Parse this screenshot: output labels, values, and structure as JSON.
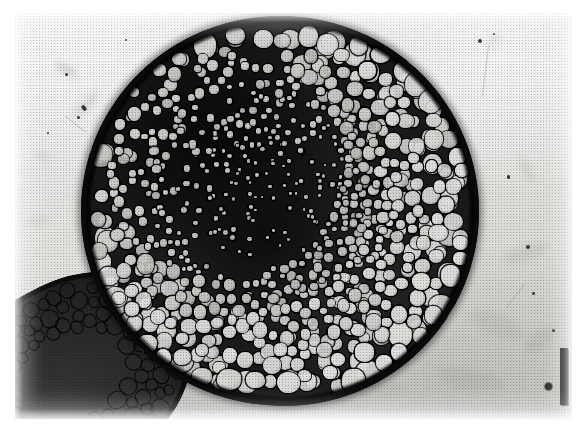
{
  "figure": {
    "kind": "light-micrograph",
    "caption_text": "",
    "background_color": "#e8e8e5",
    "ink_color": "#0a0a09",
    "plate": {
      "x": 15,
      "y": 13,
      "width": 557,
      "height": 406,
      "border_color": "#ffffff"
    }
  },
  "main_section": {
    "label": "primary circular cross-section",
    "center_x": 280,
    "center_y": 211,
    "width": 398,
    "height": 390,
    "rim_color": "#0a0a09",
    "matrix_color": "#1a1a19",
    "cell_color_light": "#ececea",
    "cell_color_mid": "#bdbdba",
    "rim_thickness_px": 7,
    "description": "dense field of rounded parenchyma cells, large at the periphery, smaller toward the centre, set in a dark-stained matrix"
  },
  "dark_core": {
    "label": "dark stained central mass",
    "center_x_pct": 36,
    "center_y_pct": 38,
    "color": "#090908"
  },
  "partial_section": {
    "label": "partial second section, lower left",
    "x": -52,
    "y": 282,
    "width": 248,
    "height": 190,
    "rotation_deg": -27,
    "rim_color": "#0d0d0c",
    "matrix_color": "#2c2c2a",
    "description": "obliquely cut fragment entering from the lower-left corner, showing its own dark boundary and a single rank of rounded cells"
  },
  "scale_bar": {
    "label": "scale-bar",
    "orientation": "vertical",
    "x": 560,
    "y": 348,
    "width": 8,
    "height": 57,
    "color": "#17171d",
    "caption": ""
  },
  "marker_dot": {
    "label": "reference dot beside scale bar",
    "x": 545,
    "y": 383,
    "diameter": 7,
    "color": "#2e2e2c"
  },
  "debris": {
    "label": "slide debris and smears",
    "count": 26
  },
  "render": {
    "halftone": "on",
    "halftone_pitch_px": 3,
    "grain": "on"
  }
}
